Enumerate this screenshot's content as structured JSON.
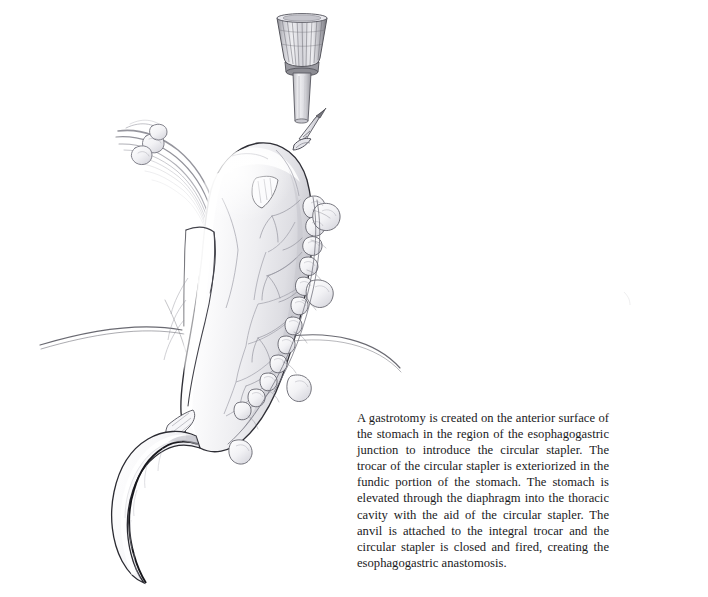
{
  "figure": {
    "caption": "A gastrotomy is created on the anterior surface of the stomach in the region of the esophagogastric junction to introduce the circular stapler. The trocar of the circular stapler is exteriorized in the fundic portion of the stomach. The stomach is elevated through the diaphragm into the thoracic cavity with the aid of the circular stapler. The anvil is attached to the integral trocar and the circular stapler is closed and fired, creating the esophagogastric anastomosis.",
    "background_color": "#ffffff",
    "text_color": "#1a1a1c",
    "ink_color": "#3a3a3e",
    "shade_color": "#d8d8dc"
  },
  "anatomy": {
    "stapler_anvil": "circular stapler anvil head",
    "stapler_shaft": "stapler shaft",
    "trocar": "integral trocar spike",
    "stomach": "gastric conduit",
    "fundus": "gastric fundus",
    "duodenum": "duodenum",
    "omentum": "omental fat nodules",
    "vessels": "gastroepiploic vessels",
    "diaphragm": "diaphragm",
    "divided_tissue": "divided short gastric vessels",
    "staple_line": "staple line"
  }
}
